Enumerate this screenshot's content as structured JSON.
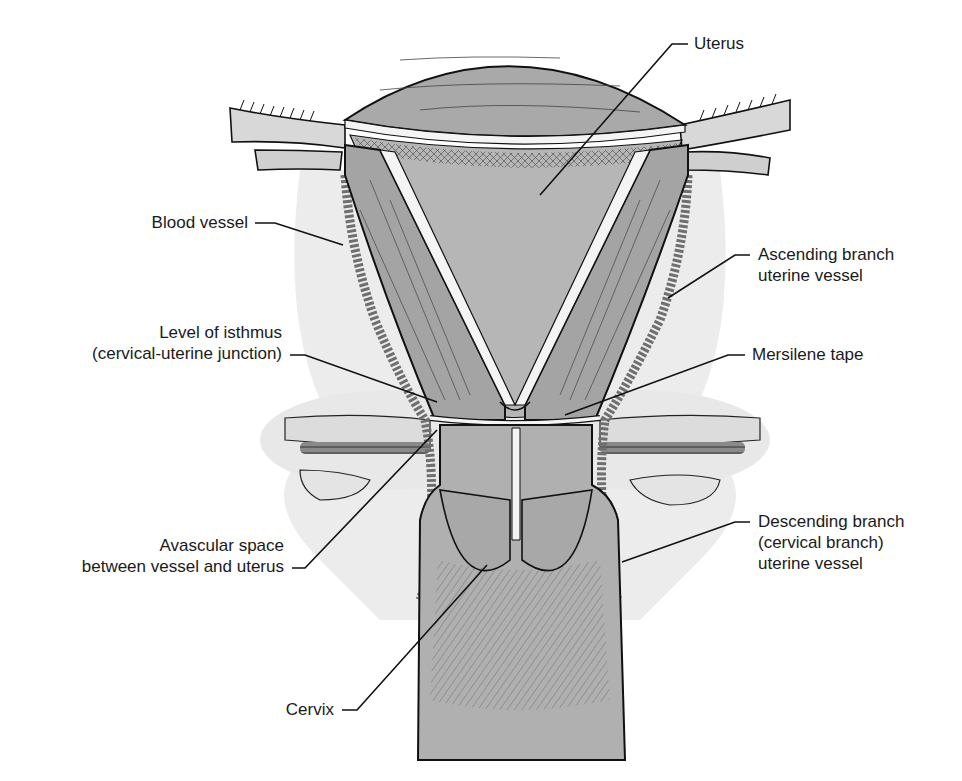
{
  "figure": {
    "type": "anatomical illustration",
    "colors": {
      "background": "#ffffff",
      "halo": "#e9e9e9",
      "tissue": "#a9a9a9",
      "tissue_light": "#bdbdbd",
      "outline": "#111111",
      "vessel": "#7a7a7a",
      "tape": "#f4f4f4",
      "text": "#1a1a1a"
    }
  },
  "labels": {
    "uterus": "Uterus",
    "blood_vessel": "Blood vessel",
    "ascending": "Ascending branch\nuterine vessel",
    "isthmus": "Level of isthmus\n(cervical-uterine junction)",
    "mersilene": "Mersilene tape",
    "avascular": "Avascular space\nbetween vessel and uterus",
    "descending": "Descending branch\n(cervical branch)\nuterine vessel",
    "cervix": "Cervix"
  }
}
